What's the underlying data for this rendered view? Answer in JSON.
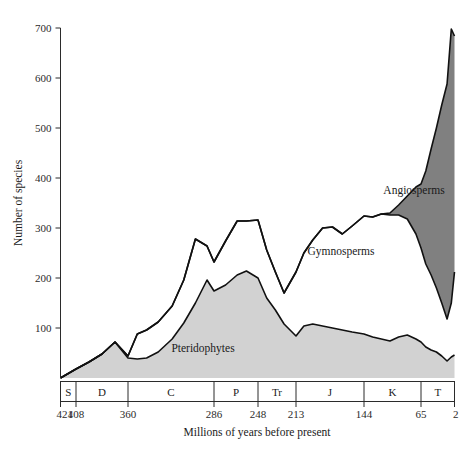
{
  "chart_data": {
    "type": "area",
    "title": "",
    "subtitle": "",
    "xlabel": "Millions of years before present",
    "ylabel": "Number of species",
    "stacked": true,
    "grid": false,
    "legend_position": "inline-labels",
    "xlim": [
      421,
      2
    ],
    "ylim": [
      0,
      700
    ],
    "x_axis_direction": "decreasing",
    "yticks": [
      100,
      200,
      300,
      400,
      500,
      600,
      700
    ],
    "ytick_labels": [
      "100",
      "200",
      "300",
      "400",
      "500",
      "600",
      "700"
    ],
    "xticks": [
      421,
      408,
      360,
      286,
      248,
      213,
      144,
      65,
      2
    ],
    "xtick_labels": [
      "421",
      "408",
      "360",
      "286",
      "248",
      "213",
      "144",
      "65",
      "2"
    ],
    "period_bands": [
      {
        "label": "S",
        "name": "Silurian",
        "start": 421,
        "end": 408
      },
      {
        "label": "D",
        "name": "Devonian",
        "start": 408,
        "end": 360
      },
      {
        "label": "C",
        "name": "Carboniferous",
        "start": 360,
        "end": 286
      },
      {
        "label": "P",
        "name": "Permian",
        "start": 286,
        "end": 248
      },
      {
        "label": "Tr",
        "name": "Triassic",
        "start": 248,
        "end": 213
      },
      {
        "label": "J",
        "name": "Jurassic",
        "start": 213,
        "end": 144
      },
      {
        "label": "K",
        "name": "Cretaceous",
        "start": 144,
        "end": 65
      },
      {
        "label": "T",
        "name": "Tertiary",
        "start": 65,
        "end": 2
      }
    ],
    "x": [
      421,
      408,
      396,
      384,
      372,
      360,
      352,
      344,
      334,
      322,
      312,
      302,
      292,
      286,
      276,
      266,
      258,
      248,
      240,
      232,
      224,
      213,
      205,
      196,
      186,
      176,
      166,
      156,
      144,
      132,
      120,
      108,
      96,
      84,
      72,
      65,
      56,
      46,
      36,
      26,
      16,
      8,
      2
    ],
    "series": [
      {
        "name": "Pteridophytes",
        "color": "#d2d2d2",
        "values": [
          0,
          18,
          32,
          48,
          72,
          40,
          38,
          40,
          52,
          78,
          110,
          150,
          196,
          174,
          186,
          206,
          214,
          200,
          160,
          136,
          108,
          84,
          104,
          108,
          104,
          100,
          96,
          92,
          88,
          82,
          78,
          74,
          82,
          86,
          78,
          72,
          62,
          56,
          52,
          44,
          34,
          42,
          46
        ]
      },
      {
        "name": "Gymnosperms",
        "color": "#ffffff",
        "values": [
          0,
          0,
          0,
          0,
          0,
          4,
          50,
          56,
          60,
          66,
          86,
          128,
          68,
          58,
          88,
          108,
          100,
          116,
          96,
          76,
          62,
          128,
          146,
          168,
          196,
          202,
          192,
          212,
          236,
          240,
          250,
          252,
          244,
          232,
          210,
          188,
          166,
          150,
          128,
          106,
          84,
          108,
          166
        ]
      },
      {
        "name": "Angiosperms",
        "color": "#808080",
        "values": [
          0,
          0,
          0,
          0,
          0,
          0,
          0,
          0,
          0,
          0,
          0,
          0,
          0,
          0,
          0,
          0,
          0,
          0,
          0,
          0,
          0,
          0,
          0,
          0,
          0,
          0,
          0,
          0,
          0,
          0,
          0,
          4,
          20,
          46,
          94,
          128,
          186,
          252,
          320,
          396,
          470,
          548,
          472
        ]
      }
    ],
    "annotations": [
      {
        "text": "Pteridophytes",
        "x_px": 203,
        "y_px": 352
      },
      {
        "text": "Gymnosperms",
        "x_px": 341,
        "y_px": 255
      },
      {
        "text": "Angiosperms",
        "x_px": 414,
        "y_px": 194
      }
    ]
  },
  "colors": {
    "pteridophytes_fill": "#d2d2d2",
    "gymnosperms_fill": "#ffffff",
    "angiosperms_fill": "#808080",
    "outline": "#111111",
    "axis": "#2b2b2b",
    "background": "#ffffff"
  },
  "labels": {
    "y_axis_title": "Number of species",
    "x_axis_title": "Millions of years before present",
    "band_pteridophytes": "Pteridophytes",
    "band_gymnosperms": "Gymnosperms",
    "band_angiosperms": "Angiosperms"
  },
  "yticks": [
    "700",
    "600",
    "500",
    "400",
    "300",
    "200",
    "100"
  ],
  "xticks": [
    "421",
    "408",
    "360",
    "286",
    "248",
    "213",
    "144",
    "65",
    "2"
  ],
  "periods": [
    "S",
    "D",
    "C",
    "P",
    "Tr",
    "J",
    "K",
    "T"
  ]
}
